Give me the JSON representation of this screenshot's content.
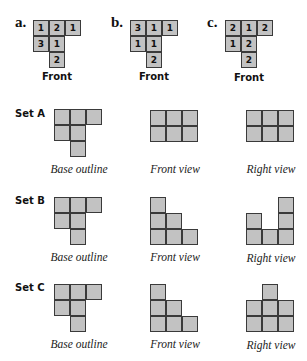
{
  "top_fragment": "",
  "problems": [
    {
      "label": "a.",
      "caption": "Front",
      "grid": [
        [
          1,
          2,
          1
        ],
        [
          3,
          1,
          null
        ],
        [
          null,
          2,
          null
        ]
      ]
    },
    {
      "label": "b.",
      "caption": "Front",
      "grid": [
        [
          3,
          1,
          1
        ],
        [
          1,
          1,
          null
        ],
        [
          null,
          2,
          null
        ]
      ]
    },
    {
      "label": "c.",
      "caption": "Front",
      "grid": [
        [
          2,
          1,
          2
        ],
        [
          1,
          2,
          null
        ],
        [
          null,
          2,
          null
        ]
      ]
    }
  ],
  "sets": [
    {
      "label": "Set A",
      "base_caption": "Base outline",
      "front_caption": "Front view",
      "right_caption": "Right view",
      "base_outline": [
        [
          1,
          1,
          1
        ],
        [
          1,
          1,
          0
        ],
        [
          0,
          1,
          0
        ]
      ],
      "front_heights": [
        2,
        2,
        2
      ],
      "right_heights": [
        2,
        2,
        2
      ]
    },
    {
      "label": "Set B",
      "base_caption": "Base outline",
      "front_caption": "Front view",
      "right_caption": "Right view",
      "base_outline": [
        [
          1,
          1,
          1
        ],
        [
          1,
          1,
          0
        ],
        [
          0,
          1,
          0
        ]
      ],
      "front_heights": [
        3,
        2,
        1
      ],
      "right_heights": [
        2,
        1,
        3
      ]
    },
    {
      "label": "Set C",
      "base_caption": "Base outline",
      "front_caption": "Front view",
      "right_caption": "Right view",
      "base_outline": [
        [
          1,
          1,
          1
        ],
        [
          1,
          1,
          0
        ],
        [
          0,
          1,
          0
        ]
      ],
      "front_heights": [
        3,
        2,
        1
      ],
      "right_heights": [
        2,
        3,
        2
      ]
    }
  ],
  "colors": {
    "cell_fill": "#c2c2c2",
    "cell_border": "#3a3a3a",
    "text": "#111111"
  }
}
